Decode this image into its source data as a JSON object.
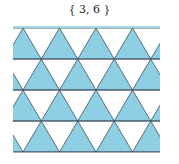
{
  "title": "{ 3, 6 }",
  "diagram": {
    "fill_color": "#8ecfe4",
    "line_color": "#3d4f5c",
    "band_color": "#9fd6e8",
    "x_min": 13,
    "x_max": 160,
    "row_lines_y": [
      28,
      59,
      90,
      121,
      152
    ],
    "triangle_side": 36.5,
    "vertices_even_rows_x": [
      23,
      59.5,
      96,
      132.5
    ],
    "vertices_odd_rows_x": [
      41.25,
      77.75,
      114.25,
      150.75
    ]
  }
}
